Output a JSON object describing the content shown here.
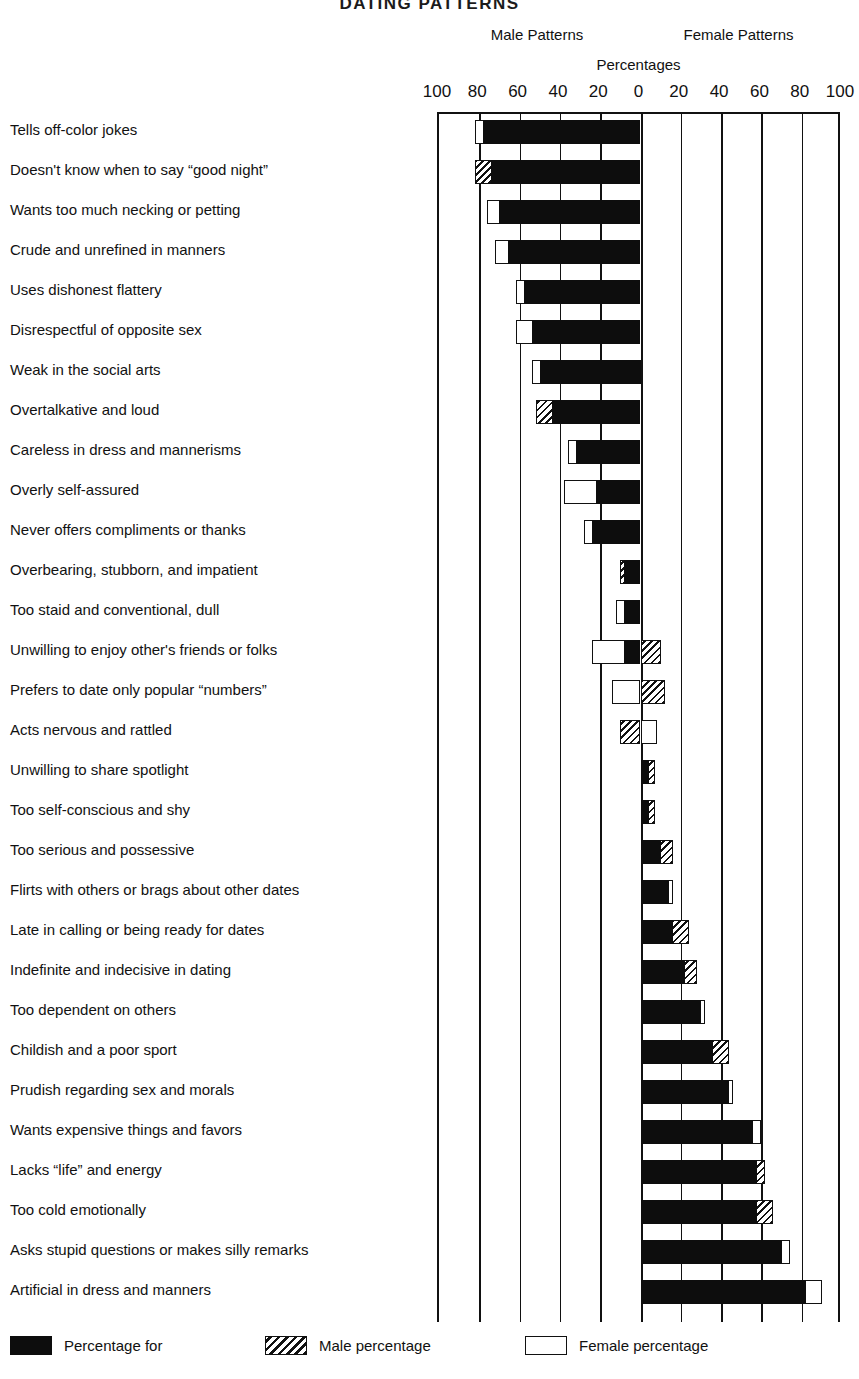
{
  "title": "DATING PATTERNS",
  "headers": {
    "male": "Male Patterns",
    "female": "Female Patterns",
    "percentages": "Percentages"
  },
  "legend": {
    "both": "Percentage for",
    "male": "Male percentage",
    "female": "Female percentage"
  },
  "colors": {
    "both": "#0d0d0d",
    "male_hatch": "#111111",
    "female_fill": "#ffffff",
    "axis": "#111111",
    "background": "#ffffff"
  },
  "chart_data": {
    "type": "bar",
    "subtype": "diverging-stacked-horizontal",
    "title": "DATING PATTERNS",
    "xlabel": "Percentages",
    "ylabel": "",
    "xlim": [
      -100,
      100
    ],
    "xticks": [
      -100,
      -80,
      -60,
      -40,
      -20,
      0,
      20,
      40,
      60,
      80,
      100
    ],
    "xtick_labels": [
      "100",
      "80",
      "60",
      "40",
      "20",
      "0",
      "20",
      "40",
      "60",
      "80",
      "100"
    ],
    "grid": true,
    "legend_position": "bottom",
    "left_axis_title": "Male Patterns",
    "right_axis_title": "Female Patterns",
    "series": [
      {
        "name": "Percentage for",
        "key": "both"
      },
      {
        "name": "Male percentage",
        "key": "male"
      },
      {
        "name": "Female percentage",
        "key": "female"
      }
    ],
    "note": "Each row is drawn from 0 outward. Negative span = Male Patterns side, positive span = Female Patterns side. Segments are given as signed start/end percentages along the shared axis.",
    "categories": [
      "Tells off-color jokes",
      "Doesn't know when to say “good night”",
      "Wants too much necking or petting",
      "Crude and unrefined in manners",
      "Uses dishonest flattery",
      "Disrespectful of opposite sex",
      "Weak in the social arts",
      "Overtalkative and loud",
      "Careless in dress and mannerisms",
      "Overly self-assured",
      "Never offers compliments or thanks",
      "Overbearing, stubborn, and impatient",
      "Too staid and conventional, dull",
      "Unwilling to enjoy other's friends or folks",
      "Prefers to date only popular “numbers”",
      "Acts nervous and rattled",
      "Unwilling to share spotlight",
      "Too self-conscious and shy",
      "Too serious and possessive",
      "Flirts with others or brags about other dates",
      "Late in calling or being ready for dates",
      "Indefinite and indecisive in dating",
      "Too dependent on others",
      "Childish and a poor sport",
      "Prudish regarding sex and morals",
      "Wants expensive things and favors",
      "Lacks “life” and energy",
      "Too cold emotionally",
      "Asks stupid questions or makes silly remarks",
      "Artificial in dress and manners"
    ],
    "rows": [
      {
        "category": "Tells off-color jokes",
        "both": -78,
        "male": 0,
        "female": -82
      },
      {
        "category": "Doesn't know when to say “good night”",
        "both": -74,
        "male": -82,
        "female": 0
      },
      {
        "category": "Wants too much necking or petting",
        "both": -70,
        "male": 0,
        "female": -76
      },
      {
        "category": "Crude and unrefined in manners",
        "both": -66,
        "male": 0,
        "female": -72
      },
      {
        "category": "Uses dishonest flattery",
        "both": -58,
        "male": 0,
        "female": -62
      },
      {
        "category": "Disrespectful of opposite sex",
        "both": -54,
        "male": 0,
        "female": -62
      },
      {
        "category": "Weak in the social arts",
        "both": -50,
        "male": 0,
        "female": -54
      },
      {
        "category": "Overtalkative and loud",
        "both": -44,
        "male": -52,
        "female": 0
      },
      {
        "category": "Careless in dress and mannerisms",
        "both": -32,
        "male": 0,
        "female": -36
      },
      {
        "category": "Overly self-assured",
        "both": -22,
        "male": 0,
        "female": -38
      },
      {
        "category": "Never offers compliments or thanks",
        "both": -24,
        "male": 0,
        "female": -28
      },
      {
        "category": "Overbearing, stubborn, and impatient",
        "both": -8,
        "male": -10,
        "female": 0
      },
      {
        "category": "Too staid and conventional, dull",
        "both": -8,
        "male": 0,
        "female": -12
      },
      {
        "category": "Unwilling to enjoy other's friends or folks",
        "both": -8,
        "male": 10,
        "female": -24
      },
      {
        "category": "Prefers to date only popular “numbers”",
        "both": 0,
        "male": 12,
        "female": -14
      },
      {
        "category": "Acts nervous and rattled",
        "both": 0,
        "male": -10,
        "female": 8
      },
      {
        "category": "Unwilling to share spotlight",
        "both": 4,
        "male": 7,
        "female": 0
      },
      {
        "category": "Too self-conscious and shy",
        "both": 4,
        "male": 7,
        "female": 0
      },
      {
        "category": "Too serious and possessive",
        "both": 10,
        "male": 16,
        "female": 0
      },
      {
        "category": "Flirts with others or brags about other dates",
        "both": 14,
        "male": 0,
        "female": 16
      },
      {
        "category": "Late in calling or being ready for dates",
        "both": 16,
        "male": 24,
        "female": 0
      },
      {
        "category": "Indefinite and indecisive in dating",
        "both": 22,
        "male": 28,
        "female": 0
      },
      {
        "category": "Too dependent on others",
        "both": 30,
        "male": 0,
        "female": 32
      },
      {
        "category": "Childish and a poor sport",
        "both": 36,
        "male": 44,
        "female": 0
      },
      {
        "category": "Prudish regarding sex and morals",
        "both": 44,
        "male": 0,
        "female": 46
      },
      {
        "category": "Wants expensive things and favors",
        "both": 56,
        "male": 0,
        "female": 60
      },
      {
        "category": "Lacks “life” and energy",
        "both": 58,
        "male": 62,
        "female": 0
      },
      {
        "category": "Too cold emotionally",
        "both": 58,
        "male": 66,
        "female": 0
      },
      {
        "category": "Asks stupid questions or makes silly remarks",
        "both": 70,
        "male": 0,
        "female": 74
      },
      {
        "category": "Artificial in dress and manners",
        "both": 82,
        "male": 0,
        "female": 90
      }
    ]
  }
}
